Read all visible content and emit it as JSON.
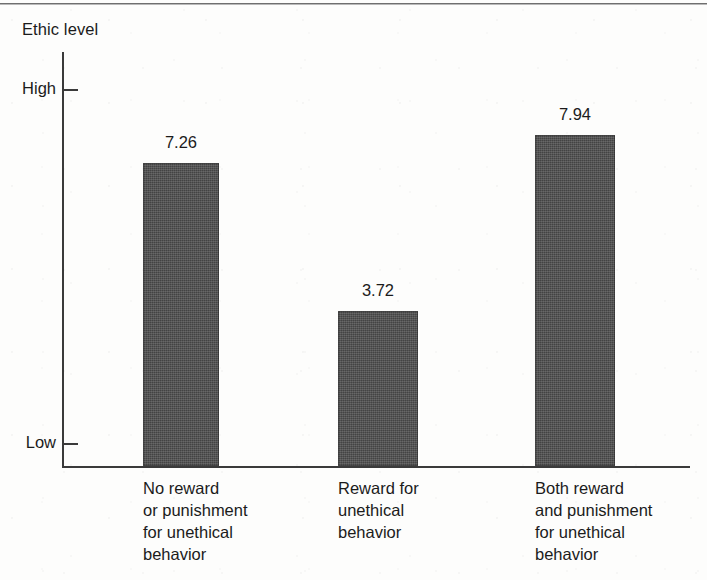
{
  "figure": {
    "axis_title": "Ethic level",
    "y_ticks": [
      {
        "label": "High",
        "y": 89
      },
      {
        "label": "Low",
        "y": 443
      }
    ],
    "bar_color": "#4d4d4d",
    "axis_color": "#3a3a3a"
  },
  "chart_data": {
    "type": "bar",
    "title": "",
    "xlabel": "",
    "ylabel": "Ethic level",
    "ylim": [
      0,
      10
    ],
    "grid": false,
    "legend": null,
    "y_tick_labels": [
      "Low",
      "High"
    ],
    "categories": [
      "No reward or punishment for unethical behavior",
      "Reward for unethical behavior",
      "Both reward and punishment for unethical behavior"
    ],
    "category_lines": [
      [
        "No reward",
        "or punishment",
        "for unethical",
        "behavior"
      ],
      [
        "Reward for",
        "unethical",
        "behavior"
      ],
      [
        "Both reward",
        "and punishment",
        "for unethical",
        "behavior"
      ]
    ],
    "values": [
      7.26,
      3.72,
      7.94
    ],
    "value_labels": [
      "7.26",
      "3.72",
      "7.94"
    ],
    "bars": [
      {
        "value_label": "7.26",
        "x": 143,
        "width": 76,
        "top": 163,
        "label_x": 143,
        "label_top": 133
      },
      {
        "value_label": "3.72",
        "x": 338,
        "width": 80,
        "top": 311,
        "label_x": 338,
        "label_top": 281
      },
      {
        "value_label": "7.94",
        "x": 535,
        "width": 80,
        "top": 135,
        "label_x": 535,
        "label_top": 105
      }
    ],
    "baseline_y": 466
  }
}
